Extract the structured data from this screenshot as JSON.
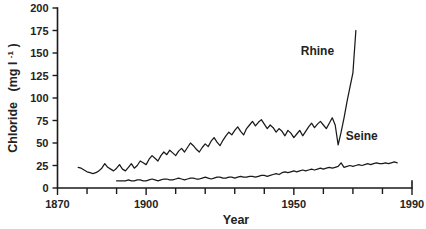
{
  "chart_data": {
    "type": "line",
    "title": "",
    "xlabel": "Year",
    "ylabel": "Chloride  (mg l-1)",
    "ylabel_main": "Chloride",
    "ylabel_unit_open": "(mg l",
    "ylabel_unit_sup": "-1",
    "ylabel_unit_close": ")",
    "xlim": [
      1870,
      1990
    ],
    "ylim": [
      0,
      200
    ],
    "yticks": [
      0,
      25,
      50,
      75,
      100,
      125,
      150,
      175,
      200
    ],
    "ytick_labels": [
      "0",
      "25",
      "50",
      "75",
      "100",
      "125",
      "150",
      "175",
      "200"
    ],
    "xticks": [
      1870,
      1880,
      1890,
      1900,
      1910,
      1920,
      1930,
      1940,
      1950,
      1960,
      1970,
      1980,
      1990
    ],
    "xtick_labels_shown": [
      "1870",
      "1900",
      "1950",
      "1990"
    ],
    "xtick_labeled_values": [
      1870,
      1900,
      1950,
      1990
    ],
    "grid": false,
    "legend": "inline-annotations",
    "annotations": [
      {
        "text": "Rhine",
        "x": 1958,
        "y": 148
      },
      {
        "text": "Seine",
        "x": 1973,
        "y": 53
      }
    ],
    "series": [
      {
        "name": "Rhine",
        "x": [
          1877,
          1878,
          1879,
          1880,
          1881,
          1882,
          1883,
          1884,
          1885,
          1886,
          1887,
          1888,
          1889,
          1890,
          1891,
          1892,
          1893,
          1894,
          1895,
          1896,
          1897,
          1898,
          1899,
          1900,
          1901,
          1902,
          1903,
          1904,
          1905,
          1906,
          1907,
          1908,
          1909,
          1910,
          1911,
          1912,
          1913,
          1914,
          1915,
          1916,
          1917,
          1918,
          1919,
          1920,
          1921,
          1922,
          1923,
          1924,
          1925,
          1926,
          1927,
          1928,
          1929,
          1930,
          1931,
          1932,
          1933,
          1934,
          1935,
          1936,
          1937,
          1938,
          1939,
          1940,
          1941,
          1942,
          1943,
          1944,
          1945,
          1946,
          1947,
          1948,
          1949,
          1950,
          1951,
          1952,
          1953,
          1954,
          1955,
          1956,
          1957,
          1958,
          1959,
          1960,
          1961,
          1962,
          1963,
          1964,
          1965,
          1966,
          1967,
          1968,
          1969,
          1970,
          1971
        ],
        "values": [
          23,
          22,
          20,
          18,
          17,
          16,
          17,
          19,
          22,
          27,
          23,
          21,
          19,
          22,
          26,
          21,
          19,
          23,
          27,
          22,
          25,
          30,
          28,
          26,
          32,
          36,
          33,
          30,
          36,
          40,
          37,
          42,
          39,
          36,
          41,
          44,
          40,
          45,
          50,
          47,
          43,
          40,
          45,
          49,
          46,
          52,
          56,
          51,
          47,
          53,
          58,
          62,
          59,
          64,
          68,
          63,
          59,
          66,
          70,
          74,
          69,
          73,
          76,
          71,
          66,
          70,
          67,
          62,
          66,
          63,
          58,
          64,
          61,
          56,
          60,
          64,
          58,
          63,
          68,
          72,
          67,
          71,
          74,
          70,
          66,
          72,
          78,
          70,
          48,
          62,
          78,
          96,
          112,
          128,
          175
        ]
      },
      {
        "name": "Seine",
        "x": [
          1890,
          1891,
          1892,
          1893,
          1894,
          1895,
          1896,
          1897,
          1898,
          1899,
          1900,
          1901,
          1902,
          1903,
          1904,
          1905,
          1906,
          1907,
          1908,
          1909,
          1910,
          1911,
          1912,
          1913,
          1914,
          1915,
          1916,
          1917,
          1918,
          1919,
          1920,
          1921,
          1922,
          1923,
          1924,
          1925,
          1926,
          1927,
          1928,
          1929,
          1930,
          1931,
          1932,
          1933,
          1934,
          1935,
          1936,
          1937,
          1938,
          1939,
          1940,
          1941,
          1942,
          1943,
          1944,
          1945,
          1946,
          1947,
          1948,
          1949,
          1950,
          1951,
          1952,
          1953,
          1954,
          1955,
          1956,
          1957,
          1958,
          1959,
          1960,
          1961,
          1962,
          1963,
          1964,
          1965,
          1966,
          1967,
          1968,
          1969,
          1970,
          1971,
          1972,
          1973,
          1974,
          1975,
          1976,
          1977,
          1978,
          1979,
          1980,
          1981,
          1982,
          1983,
          1984,
          1985
        ],
        "values": [
          8,
          8,
          8,
          8,
          9,
          8,
          8,
          9,
          9,
          8,
          8,
          9,
          10,
          9,
          8,
          9,
          10,
          10,
          9,
          9,
          10,
          11,
          10,
          9,
          10,
          11,
          11,
          10,
          10,
          11,
          12,
          11,
          10,
          11,
          12,
          12,
          11,
          11,
          12,
          12,
          11,
          12,
          13,
          12,
          12,
          13,
          13,
          12,
          13,
          14,
          14,
          13,
          14,
          15,
          16,
          15,
          17,
          18,
          17,
          18,
          19,
          18,
          19,
          20,
          19,
          20,
          21,
          20,
          21,
          22,
          21,
          22,
          23,
          22,
          23,
          24,
          28,
          23,
          24,
          25,
          24,
          25,
          26,
          25,
          26,
          27,
          26,
          27,
          28,
          27,
          27,
          28,
          27,
          28,
          29,
          28
        ]
      }
    ]
  }
}
